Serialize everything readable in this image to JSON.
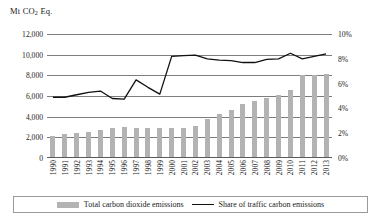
{
  "chart_data": {
    "type": "bar",
    "title": "Mt CO2 Eq.",
    "title_prefix": "Mt CO",
    "title_sub": "2",
    "title_suffix": " Eq.",
    "xlabel": "",
    "ylabel": "Mt CO2 Eq.",
    "ylabel_right": "%",
    "grid": true,
    "legend_position": "bottom",
    "categories": [
      "1990",
      "1991",
      "1992",
      "1993",
      "1994",
      "1995",
      "1996",
      "1997",
      "1998",
      "1999",
      "2000",
      "2001",
      "2002",
      "2003",
      "2004",
      "2005",
      "2006",
      "2007",
      "2008",
      "2009",
      "2010",
      "2011",
      "2012",
      "2013"
    ],
    "y_left_ticks": [
      "0",
      "2,000",
      "4,000",
      "6,000",
      "8,000",
      "10,000",
      "12,000"
    ],
    "y_left_values": [
      0,
      2000,
      4000,
      6000,
      8000,
      10000,
      12000
    ],
    "ylim": [
      0,
      12000
    ],
    "y_right_ticks": [
      "0%",
      "2%",
      "4%",
      "6%",
      "8%",
      "10%"
    ],
    "y_right_values": [
      0,
      2,
      4,
      6,
      8,
      10
    ],
    "ylim_right": [
      0,
      10
    ],
    "series": [
      {
        "name": "Total carbon dioxide emissions",
        "type": "bar",
        "axis": "left",
        "unit": "Mt CO2 Eq.",
        "color": "#b3b3b3",
        "values": [
          2150,
          2300,
          2400,
          2550,
          2700,
          2950,
          3000,
          2950,
          2900,
          2900,
          2900,
          2950,
          3100,
          3750,
          4300,
          4600,
          5200,
          5500,
          5800,
          6050,
          6600,
          8000,
          8050,
          8100
        ]
      },
      {
        "name": "Share of traffic carbon emissions",
        "type": "line",
        "axis": "right",
        "unit": "%",
        "color": "#111111",
        "values": [
          4.9,
          4.9,
          5.1,
          5.3,
          5.4,
          4.8,
          4.75,
          6.3,
          5.7,
          5.15,
          8.2,
          8.25,
          8.3,
          8.0,
          7.9,
          7.85,
          7.7,
          7.7,
          7.95,
          8.0,
          8.45,
          8.0,
          8.2,
          8.4
        ]
      }
    ]
  },
  "legend": {
    "bar_label": "Total carbon dioxide emissions",
    "line_label": "Share of traffic carbon emissions"
  }
}
